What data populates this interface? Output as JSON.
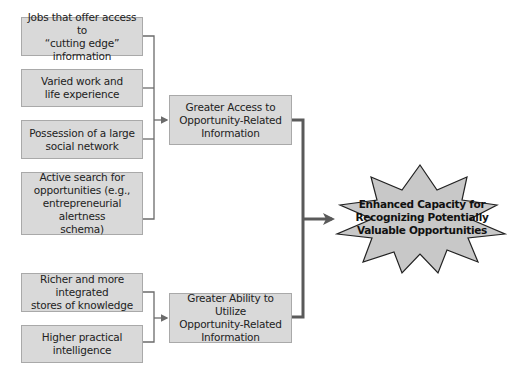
{
  "diagram": {
    "inputs_access": [
      {
        "label": "Jobs that offer access to\n“cutting edge” information"
      },
      {
        "label": "Varied work and\nlife experience"
      },
      {
        "label": "Possession of a large\nsocial network"
      },
      {
        "label": "Active search for\nopportunities (e.g.,\nentrepreneurial alertness\nschema)"
      }
    ],
    "inputs_ability": [
      {
        "label": "Richer and more integrated\nstores of knowledge"
      },
      {
        "label": "Higher practical\nintelligence"
      }
    ],
    "mediators": [
      {
        "label": "Greater Access to\nOpportunity-Related\nInformation"
      },
      {
        "label": "Greater Ability to Utilize\nOpportunity-Related\nInformation"
      }
    ],
    "outcome": {
      "label": "Enhanced Capacity for\nRecognizing Potentially\nValuable Opportunities"
    },
    "colors": {
      "box_fill": "#d9d9d9",
      "box_border": "#a9a9a9",
      "connector": "#6b6b6b",
      "star_fill": "#c8c8c8",
      "star_stroke": "#222222"
    }
  }
}
